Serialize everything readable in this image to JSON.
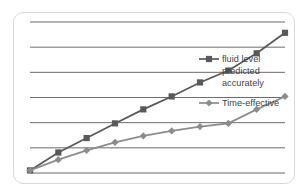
{
  "chart_data": {
    "type": "line",
    "title": "",
    "xlabel": "",
    "ylabel": "",
    "grid": true,
    "gridlines": 7,
    "xlim": [
      0,
      9
    ],
    "ylim": [
      0,
      7
    ],
    "x": [
      0,
      1,
      2,
      3,
      4,
      5,
      6,
      7,
      8,
      9
    ],
    "legend_position": "inside-right",
    "series": [
      {
        "name": "fluid level predicted accurately",
        "marker": "square",
        "color": "#595959",
        "values": [
          0.12,
          0.95,
          1.62,
          2.3,
          2.95,
          3.55,
          4.2,
          4.75,
          5.55,
          6.5
        ]
      },
      {
        "name": "Time-effective",
        "marker": "diamond",
        "color": "#8c8c8c",
        "values": [
          0.12,
          0.62,
          1.05,
          1.42,
          1.72,
          1.95,
          2.15,
          2.3,
          2.95,
          3.55
        ]
      }
    ]
  },
  "legend": {
    "entries": [
      {
        "label_line1": "fluid level",
        "label_line2": "predicted",
        "label_line3": "accurately",
        "marker": "square",
        "color": "#595959"
      },
      {
        "label_line1": "Time-effective",
        "marker": "diamond",
        "color": "#8c8c8c"
      }
    ]
  },
  "colors": {
    "frame_border": "#d9d9d9",
    "gridline": "#404040",
    "background": "#ffffff",
    "series_primary": "#595959",
    "series_secondary": "#8c8c8c",
    "legend_text": "#3f3f3f"
  }
}
